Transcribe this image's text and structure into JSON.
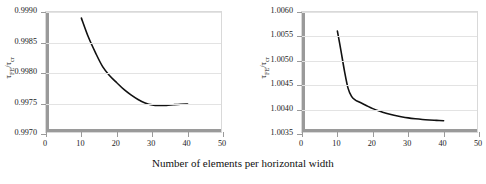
{
  "figure": {
    "xcaption": "Number of elements per horizontal width",
    "ylabel_html": "τ_FE/τ_cr"
  },
  "chart_data": [
    {
      "type": "line",
      "title": "Simple juncture",
      "xlabel": "Number of elements per horizontal width",
      "ylabel": "τFE/τcr",
      "xlim": [
        0,
        50
      ],
      "ylim": [
        0.997,
        0.999
      ],
      "xticks": [
        0,
        10,
        20,
        30,
        40,
        50
      ],
      "xtick_labels": [
        "0",
        "10",
        "20",
        "30",
        "40",
        "50"
      ],
      "yticks": [
        0.997,
        0.9975,
        0.998,
        0.9985,
        0.999
      ],
      "ytick_labels": [
        "0.9970",
        "0.9975",
        "0.9980",
        "0.9985",
        "0.9990"
      ],
      "grid": true,
      "legend": "none",
      "x": [
        10,
        12,
        14,
        16,
        18,
        20,
        22,
        24,
        26,
        28,
        30,
        32,
        34,
        36,
        38,
        40
      ],
      "values": [
        0.9989,
        0.998585,
        0.99833,
        0.998105,
        0.997955,
        0.99784,
        0.99773,
        0.99764,
        0.997565,
        0.99751,
        0.997478,
        0.997468,
        0.99747,
        0.99748,
        0.997488,
        0.997492
      ]
    },
    {
      "type": "line",
      "title": "Fixed juncture",
      "xlabel": "Number of elements per horizontal width",
      "ylabel": "τFE/τcr",
      "xlim": [
        0,
        50
      ],
      "ylim": [
        1.0035,
        1.006
      ],
      "xticks": [
        0,
        10,
        20,
        30,
        40,
        50
      ],
      "xtick_labels": [
        "0",
        "10",
        "20",
        "30",
        "40",
        "50"
      ],
      "yticks": [
        1.0035,
        1.004,
        1.0045,
        1.005,
        1.0055,
        1.006
      ],
      "ytick_labels": [
        "1.0035",
        "1.0040",
        "1.0045",
        "1.0050",
        "1.0055",
        "1.0060"
      ],
      "grid": true,
      "legend": "none",
      "x": [
        10,
        11,
        12,
        13,
        14,
        15,
        16,
        18,
        20,
        22,
        24,
        26,
        28,
        30,
        32,
        34,
        36,
        38,
        40
      ],
      "values": [
        1.00561,
        1.00521,
        1.00479,
        1.00444,
        1.00427,
        1.0042,
        1.00416,
        1.00409,
        1.00402,
        1.003965,
        1.00392,
        1.003885,
        1.003855,
        1.00383,
        1.003812,
        1.003798,
        1.003788,
        1.00378,
        1.003772
      ]
    }
  ],
  "colors": {
    "curve": "#111111",
    "axis": "#9a9a9a",
    "grid": "#e3e3e3",
    "frame": "#d9d9d9",
    "background": "#ffffff"
  }
}
